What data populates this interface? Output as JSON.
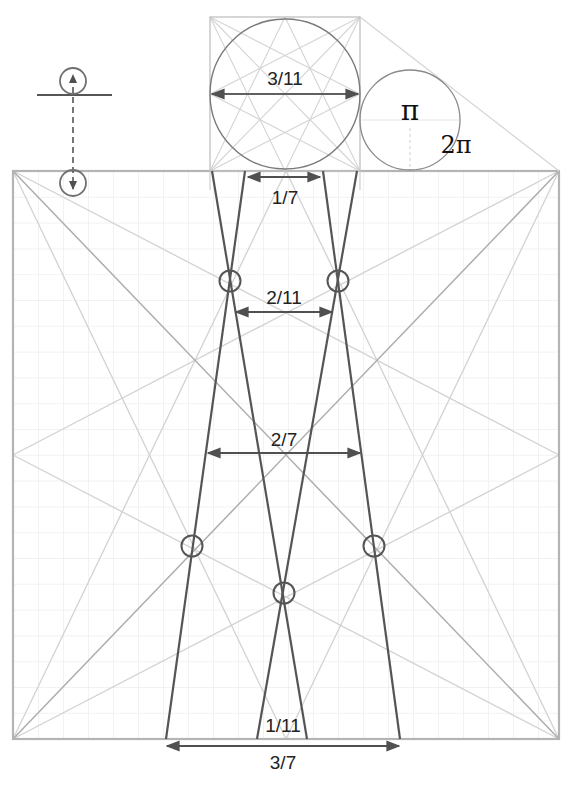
{
  "diagram": {
    "colors": {
      "background": "#ffffff",
      "grid": "#e6e6e6",
      "frame": "#b4b4b4",
      "construction_light": "#cfcfcf",
      "construction_medium": "#a8a8a8",
      "dark_line": "#505050",
      "text": "#222222"
    },
    "labels": {
      "top_circle_diameter": "3/11",
      "top_gap": "1/7",
      "upper_crossing_gap": "2/11",
      "middle_gap": "2/7",
      "bottom_inner_gap": "1/11",
      "bottom_outer_gap": "3/7",
      "pi": "π",
      "two_pi": "2π"
    },
    "legend": {
      "icon": "circle-on-line-with-dashed-arrow",
      "description": "circle rolled down onto square top edge"
    },
    "square": {
      "x": 13,
      "y": 171,
      "width": 546,
      "height": 568,
      "grid_step": 25
    },
    "small_square": {
      "x": 210,
      "y": 17,
      "width": 150,
      "height": 154
    },
    "circles": {
      "big": {
        "cx": 285,
        "cy": 94,
        "r": 75
      },
      "small": {
        "cx": 410,
        "cy": 120,
        "r": 50
      },
      "markers": [
        {
          "cx": 230,
          "cy": 281,
          "r": 11
        },
        {
          "cx": 338,
          "cy": 281,
          "r": 11
        },
        {
          "cx": 192,
          "cy": 546,
          "r": 11
        },
        {
          "cx": 374,
          "cy": 546,
          "r": 11
        },
        {
          "cx": 284,
          "cy": 593,
          "r": 11
        }
      ]
    }
  }
}
